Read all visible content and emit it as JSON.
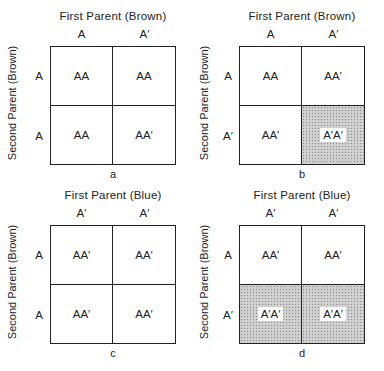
{
  "figure": {
    "panels": [
      {
        "label": "a",
        "top_title": "First Parent (Brown)",
        "side_title": "Second Parent (Brown)",
        "columns": [
          "A",
          "A′"
        ],
        "rows": [
          "A",
          "A"
        ],
        "cells": [
          [
            "AA",
            "AA"
          ],
          [
            "AA",
            "AA′"
          ]
        ],
        "shaded": [
          [
            false,
            false
          ],
          [
            false,
            false
          ]
        ]
      },
      {
        "label": "b",
        "top_title": "First Parent (Brown)",
        "side_title": "Second Parent (Brown)",
        "columns": [
          "A",
          "A′"
        ],
        "rows": [
          "A",
          "A′"
        ],
        "cells": [
          [
            "AA",
            "AA′"
          ],
          [
            "AA′",
            "A′A′"
          ]
        ],
        "shaded": [
          [
            false,
            false
          ],
          [
            false,
            true
          ]
        ]
      },
      {
        "label": "c",
        "top_title": "First Parent (Blue)",
        "side_title": "Second Parent (Brown)",
        "columns": [
          "A′",
          "A′"
        ],
        "rows": [
          "A",
          "A"
        ],
        "cells": [
          [
            "AA′",
            "AA′"
          ],
          [
            "AA′",
            "AA′"
          ]
        ],
        "shaded": [
          [
            false,
            false
          ],
          [
            false,
            false
          ]
        ]
      },
      {
        "label": "d",
        "top_title": "First Parent (Blue)",
        "side_title": "Second Parent (Brown)",
        "columns": [
          "A′",
          "A′"
        ],
        "rows": [
          "A",
          "A′"
        ],
        "cells": [
          [
            "AA′",
            "AA′"
          ],
          [
            "A′A′",
            "A′A′"
          ]
        ],
        "shaded": [
          [
            false,
            false
          ],
          [
            true,
            true
          ]
        ]
      }
    ],
    "colors": {
      "line": "#222222",
      "shade": "#cfcfcf",
      "background": "#ffffff"
    }
  }
}
